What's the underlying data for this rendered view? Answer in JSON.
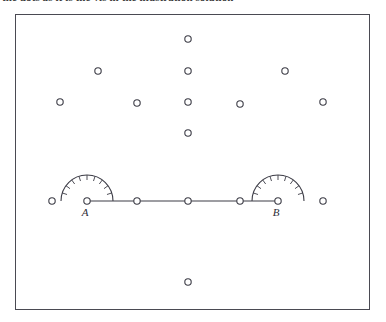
{
  "caption": {
    "text": "the dots as it is the vis in the illustration solution"
  },
  "figure": {
    "frame": {
      "x": 15,
      "y": 14,
      "width": 355,
      "height": 296,
      "stroke": "#4a4a52"
    },
    "colors": {
      "ink": "#3c3c46",
      "label_ink": "#2e2e36",
      "paper": "#ffffff"
    },
    "points": [
      {
        "name": "A",
        "label": "A",
        "x": 87,
        "y": 201,
        "labelled": true,
        "label_dx": -2,
        "label_dy": 15
      },
      {
        "name": "B",
        "label": "B",
        "x": 278,
        "y": 201,
        "labelled": true,
        "label_dx": -2,
        "label_dy": 15
      }
    ],
    "line_dots": [
      {
        "name": "baseline-dot-left-outer",
        "x": 52,
        "y": 201,
        "on_segment": false
      },
      {
        "name": "baseline-dot-A",
        "x": 87,
        "y": 201,
        "on_segment": true
      },
      {
        "name": "baseline-dot-mid-1",
        "x": 137,
        "y": 201,
        "on_segment": true
      },
      {
        "name": "baseline-dot-center",
        "x": 188,
        "y": 201,
        "on_segment": true
      },
      {
        "name": "baseline-dot-mid-2",
        "x": 240,
        "y": 201,
        "on_segment": true
      },
      {
        "name": "baseline-dot-B",
        "x": 278,
        "y": 201,
        "on_segment": true
      },
      {
        "name": "baseline-dot-right-outer",
        "x": 323,
        "y": 201,
        "on_segment": false
      }
    ],
    "segment": {
      "x1": 87,
      "y1": 201,
      "x2": 278,
      "y2": 201
    },
    "scatter_dots": [
      {
        "name": "dot-top-center",
        "x": 188,
        "y": 39
      },
      {
        "name": "dot-upper-left",
        "x": 98,
        "y": 71
      },
      {
        "name": "dot-upper-center",
        "x": 188,
        "y": 71
      },
      {
        "name": "dot-upper-right",
        "x": 285,
        "y": 71
      },
      {
        "name": "dot-mid-far-left",
        "x": 60,
        "y": 102
      },
      {
        "name": "dot-mid-left",
        "x": 137,
        "y": 103
      },
      {
        "name": "dot-mid-center",
        "x": 188,
        "y": 102
      },
      {
        "name": "dot-mid-right",
        "x": 240,
        "y": 104
      },
      {
        "name": "dot-mid-far-right",
        "x": 323,
        "y": 102
      },
      {
        "name": "dot-lower-center",
        "x": 188,
        "y": 133
      },
      {
        "name": "dot-bottom-center",
        "x": 188,
        "y": 282
      }
    ],
    "dot_radius": 3.2,
    "protractors": [
      {
        "name": "protractor-at-A",
        "cx": 87,
        "cy": 201,
        "radius": 26,
        "tick_count": 9,
        "tick_length": 5
      },
      {
        "name": "protractor-at-B",
        "cx": 278,
        "cy": 201,
        "radius": 26,
        "tick_count": 9,
        "tick_length": 5
      }
    ]
  }
}
